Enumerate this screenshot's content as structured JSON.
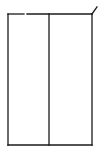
{
  "figure": {
    "stroke_color": "#1a1a1a",
    "background": "#ffffff",
    "panels": 2
  }
}
